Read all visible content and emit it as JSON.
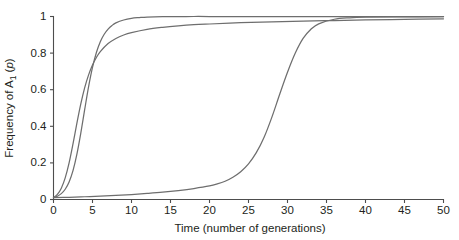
{
  "chart_data": {
    "type": "line",
    "title": "",
    "xlabel": "Time (number of generations)",
    "ylabel_parts": {
      "prefix": "Frequency of A",
      "subscript": "1",
      "suffix_open": " (",
      "italic": "p",
      "suffix_close": ")"
    },
    "ylabel": "Frequency of A1 (p)",
    "xlim": [
      0,
      50
    ],
    "ylim": [
      0,
      1
    ],
    "xticks": [
      0,
      5,
      10,
      15,
      20,
      25,
      30,
      35,
      40,
      45,
      50
    ],
    "xticklabels": [
      "0",
      "5",
      "10",
      "15",
      "20",
      "25",
      "30",
      "35",
      "40",
      "45",
      "50"
    ],
    "yticks": [
      0,
      0.2,
      0.4,
      0.6,
      0.8,
      1
    ],
    "yticklabels": [
      "0",
      "0.2",
      "0.4",
      "0.6",
      "0.8",
      "1"
    ],
    "grid": false,
    "legend": "none",
    "line_color": "#6e6e6e",
    "axis_color": "#4d4d4d",
    "series": [
      {
        "name": "strong-selection-curve",
        "description": "Fastest rise, sigmoid reaching 1.0 by generation 12",
        "x": [
          0,
          0.5,
          1,
          1.5,
          2,
          2.5,
          3,
          3.5,
          4,
          4.5,
          5,
          5.5,
          6,
          6.5,
          7,
          7.5,
          8,
          9,
          10,
          11,
          12,
          14,
          16,
          18,
          20,
          25,
          30,
          35,
          40,
          45,
          50
        ],
        "values": [
          0.01,
          0.018,
          0.032,
          0.056,
          0.096,
          0.158,
          0.248,
          0.363,
          0.492,
          0.617,
          0.722,
          0.803,
          0.862,
          0.903,
          0.931,
          0.951,
          0.965,
          0.981,
          0.99,
          0.994,
          0.997,
          0.999,
          0.999,
          1.0,
          1.0,
          1.0,
          1.0,
          1.0,
          1.0,
          1.0,
          1.0
        ]
      },
      {
        "name": "moderate-selection-curve",
        "description": "Rises fast early then approaches 0.98 asymptote more gradually",
        "x": [
          0,
          0.5,
          1,
          1.5,
          2,
          2.5,
          3,
          3.5,
          4,
          4.5,
          5,
          5.5,
          6,
          7,
          8,
          9,
          10,
          12,
          14,
          16,
          18,
          20,
          24,
          28,
          32,
          36,
          40,
          45,
          50
        ],
        "values": [
          0.01,
          0.028,
          0.062,
          0.118,
          0.2,
          0.304,
          0.417,
          0.522,
          0.611,
          0.681,
          0.735,
          0.776,
          0.808,
          0.852,
          0.88,
          0.899,
          0.912,
          0.93,
          0.941,
          0.949,
          0.955,
          0.959,
          0.966,
          0.971,
          0.975,
          0.978,
          0.981,
          0.984,
          0.987
        ]
      },
      {
        "name": "weak-selection-curve",
        "description": "Flat near zero until generation 20, steep rise centered at generation 30, plateau at 1.0",
        "x": [
          0,
          2,
          4,
          6,
          8,
          10,
          12,
          14,
          16,
          18,
          20,
          21,
          22,
          23,
          24,
          25,
          26,
          27,
          28,
          29,
          30,
          31,
          32,
          33,
          34,
          36,
          38,
          40,
          44,
          50
        ],
        "values": [
          0.01,
          0.012,
          0.015,
          0.018,
          0.022,
          0.027,
          0.033,
          0.04,
          0.049,
          0.06,
          0.074,
          0.085,
          0.1,
          0.122,
          0.152,
          0.195,
          0.256,
          0.34,
          0.45,
          0.575,
          0.695,
          0.8,
          0.88,
          0.93,
          0.96,
          0.985,
          0.993,
          0.996,
          0.998,
          0.999
        ]
      }
    ]
  }
}
